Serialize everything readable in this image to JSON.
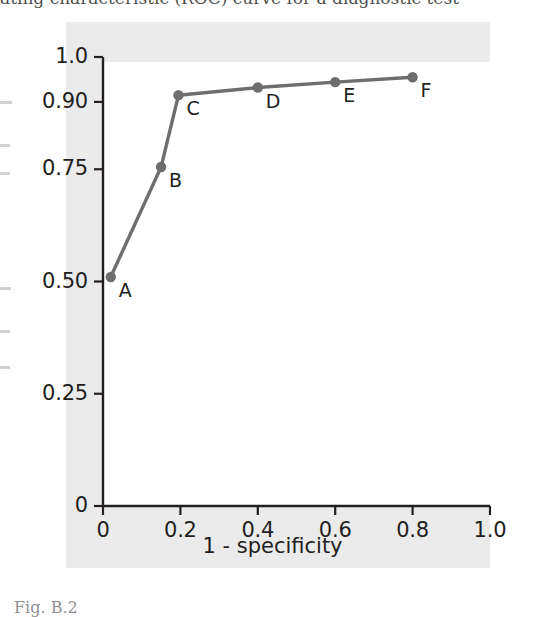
{
  "figure": {
    "caption": "Fig. B.2",
    "cut_top_text": "ating characteristic (ROC) curve for a diagnostic test"
  },
  "chart_data": {
    "type": "line",
    "title": "",
    "xlabel": "1 - specificity",
    "ylabel": "",
    "xlim": [
      0,
      1.0
    ],
    "ylim": [
      0,
      1.0
    ],
    "grid": false,
    "legend": "none",
    "xticks": [
      "0",
      "0.2",
      "0.4",
      "0.6",
      "0.8",
      "1.0"
    ],
    "xtick_values": [
      0,
      0.2,
      0.4,
      0.6,
      0.8,
      1.0
    ],
    "yticks": [
      "0",
      "0.25",
      "0.50",
      "0.75",
      "0.90",
      "1.0"
    ],
    "ytick_values": [
      0,
      0.25,
      0.5,
      0.75,
      0.9,
      1.0
    ],
    "series": [
      {
        "name": "ROC curve",
        "color": "#6e6e6e",
        "marker": "circle",
        "points": [
          {
            "label": "A",
            "x": 0.02,
            "y": 0.51
          },
          {
            "label": "B",
            "x": 0.15,
            "y": 0.755
          },
          {
            "label": "C",
            "x": 0.195,
            "y": 0.915
          },
          {
            "label": "D",
            "x": 0.4,
            "y": 0.932
          },
          {
            "label": "E",
            "x": 0.6,
            "y": 0.944
          },
          {
            "label": "F",
            "x": 0.8,
            "y": 0.955
          }
        ]
      }
    ]
  }
}
